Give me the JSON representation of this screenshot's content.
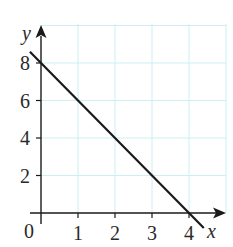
{
  "chart_data": {
    "type": "line",
    "title": "",
    "xlabel": "x",
    "ylabel": "y",
    "origin_label": "0",
    "xlim": [
      0,
      4
    ],
    "ylim": [
      0,
      9
    ],
    "x_ticks": [
      1,
      2,
      3,
      4
    ],
    "x_tick_labels": [
      "1",
      "2",
      "3",
      "4"
    ],
    "y_ticks": [
      2,
      4,
      6,
      8
    ],
    "y_tick_labels": [
      "2",
      "4",
      "6",
      "8"
    ],
    "grid": true,
    "grid_color": "#cdeef4",
    "line_color": "#1a1a1a",
    "series": [
      {
        "name": "line",
        "x": [
          -0.3,
          0,
          4,
          4.4
        ],
        "y": [
          8.6,
          8,
          0,
          -0.8
        ],
        "equation": "y = 8 - 2x"
      }
    ],
    "intercepts": {
      "y_intercept": 8,
      "x_intercept": 4
    }
  }
}
